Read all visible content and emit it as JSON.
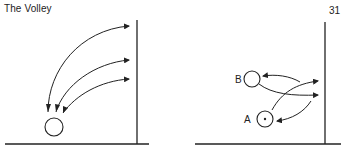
{
  "header": {
    "title": "The Volley",
    "page_number": "31"
  },
  "figures": [
    {
      "name": "volley-from-floor",
      "elements": [
        "wall",
        "floor",
        "ball",
        "three curved arrows to wall and back"
      ]
    },
    {
      "name": "volley-exchange",
      "labels": {
        "a": "A",
        "b": "B"
      },
      "elements": [
        "wall",
        "floor",
        "player B circle",
        "player A circle with dot",
        "crossing arrows"
      ]
    }
  ],
  "colors": {
    "ink": "#222222",
    "background": "#ffffff"
  }
}
